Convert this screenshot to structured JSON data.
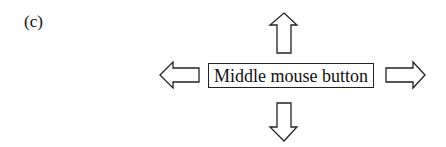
{
  "panel_label": "(c)",
  "center_box": {
    "text": "Middle mouse button"
  },
  "arrows": [
    {
      "direction": "up",
      "icon": "arrow-up-outline-icon"
    },
    {
      "direction": "down",
      "icon": "arrow-down-outline-icon"
    },
    {
      "direction": "left",
      "icon": "arrow-left-outline-icon"
    },
    {
      "direction": "right",
      "icon": "arrow-right-outline-icon"
    }
  ],
  "colors": {
    "stroke": "#222222",
    "background": "#ffffff"
  }
}
